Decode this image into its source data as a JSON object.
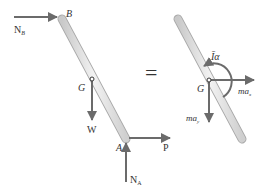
{
  "colors": {
    "arrow": "#6b6b6b",
    "bar_fill": "#dcdcdc",
    "bar_stroke": "#a8a8a8",
    "text": "#333333",
    "background": "#ffffff"
  },
  "left_diagram": {
    "title": "Free-body diagram",
    "points": {
      "B": "B",
      "G": "G",
      "A": "A"
    },
    "forces": {
      "N_B": {
        "label": "N",
        "subscript": "B"
      },
      "W": {
        "label": "W"
      },
      "P": {
        "label": "P"
      },
      "N_A": {
        "label": "N",
        "subscript": "A"
      }
    }
  },
  "equals_sign": "=",
  "right_diagram": {
    "title": "Kinetic diagram",
    "points": {
      "G": "G"
    },
    "effective_forces": {
      "I_alpha": {
        "label": "Īα"
      },
      "m_ax": {
        "label": "ma",
        "subscript": "x"
      },
      "m_ay": {
        "label": "ma",
        "subscript": "y"
      }
    }
  }
}
